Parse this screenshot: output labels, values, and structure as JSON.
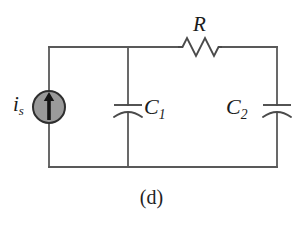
{
  "figure": {
    "caption": "(d)",
    "background_color": "#ffffff",
    "width": 303,
    "height": 228
  },
  "colors": {
    "wire": "#595959",
    "component": "#4a4a4a",
    "source_fill": "#9a9a9a",
    "source_border": "#2e2e2e",
    "arrow": "#151515",
    "label": "#1a1a1a"
  },
  "circuit": {
    "type": "schematic",
    "topology": "current source in parallel with C1, feeding R in series to C2",
    "geometry": {
      "left_rail_x": 49,
      "middle_branch_x": 128,
      "right_rail_x": 277,
      "top_wire_y": 47,
      "bottom_wire_y": 167
    },
    "nodes": [
      {
        "name": "top-left-corner",
        "x": 49,
        "y": 47
      },
      {
        "name": "top-middle-node",
        "x": 128,
        "y": 47
      },
      {
        "name": "top-right-corner",
        "x": 277,
        "y": 47
      },
      {
        "name": "bottom-left-corner",
        "x": 49,
        "y": 167
      },
      {
        "name": "bottom-middle-node",
        "x": 128,
        "y": 167
      },
      {
        "name": "bottom-right-corner",
        "x": 277,
        "y": 167
      }
    ],
    "components": [
      {
        "id": "source",
        "kind": "current-source",
        "symbol": "circle-with-up-arrow",
        "label": "i",
        "subscript": "s",
        "label_position": "left",
        "branch": "left-rail",
        "center_x": 49,
        "center_y": 107,
        "radius": 16,
        "arrow_direction": "up"
      },
      {
        "id": "resistor",
        "kind": "resistor",
        "symbol": "zigzag",
        "label": "R",
        "subscript": "",
        "label_position": "above",
        "branch": "top-wire",
        "x_start": 178,
        "x_end": 222,
        "y": 47,
        "peaks": 4
      },
      {
        "id": "capacitor-1",
        "kind": "capacitor",
        "symbol": "flat-plate-over-curved-plate",
        "label": "C",
        "subscript": "1",
        "label_position": "right",
        "branch": "middle-branch",
        "center_x": 128,
        "plate_y": 105,
        "plate_width": 28
      },
      {
        "id": "capacitor-2",
        "kind": "capacitor",
        "symbol": "flat-plate-over-curved-plate",
        "label": "C",
        "subscript": "2",
        "label_position": "left",
        "branch": "right-rail",
        "center_x": 277,
        "plate_y": 105,
        "plate_width": 28
      }
    ]
  },
  "labels": {
    "source": {
      "base": "i",
      "sub": "s"
    },
    "resistor": {
      "base": "R",
      "sub": ""
    },
    "capacitor_1": {
      "base": "C",
      "sub": "1"
    },
    "capacitor_2": {
      "base": "C",
      "sub": "2"
    }
  }
}
